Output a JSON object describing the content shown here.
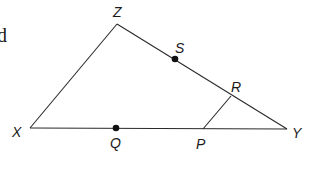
{
  "figure": {
    "text_fragment": "d",
    "vertices": {
      "Z": {
        "label": "Z",
        "x": 117,
        "y": 24
      },
      "X": {
        "label": "X",
        "x": 30,
        "y": 128
      },
      "Y": {
        "label": "Y",
        "x": 287,
        "y": 129
      }
    },
    "points": {
      "S": {
        "label": "S",
        "x": 175,
        "y": 59,
        "marked": true
      },
      "R": {
        "label": "R",
        "x": 231,
        "y": 96,
        "marked": false
      },
      "P": {
        "label": "P",
        "x": 203,
        "y": 129,
        "marked": false
      },
      "Q": {
        "label": "Q",
        "x": 116,
        "y": 128,
        "marked": true
      }
    },
    "segments": [
      {
        "from": "X",
        "to": "Z"
      },
      {
        "from": "Z",
        "to": "Y"
      },
      {
        "from": "X",
        "to": "Y"
      },
      {
        "from": "P",
        "to": "R"
      }
    ],
    "colors": {
      "line": "#2a2a2a",
      "dot": "#111111",
      "background": "#ffffff"
    }
  }
}
